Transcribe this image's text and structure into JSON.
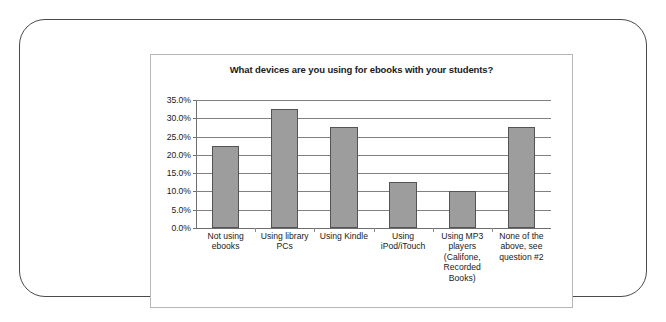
{
  "chart_data": {
    "type": "bar",
    "title": "What devices are you using for ebooks with your students?",
    "xlabel": "",
    "ylabel": "",
    "categories": [
      "Not using ebooks",
      "Using library PCs",
      "Using Kindle",
      "Using iPod/iTouch",
      "Using MP3 players (Califone, Recorded Books)",
      "None of the above, see question #2"
    ],
    "values": [
      22.5,
      32.5,
      27.5,
      12.5,
      10.0,
      27.5
    ],
    "ylim": [
      0,
      35
    ],
    "ytick_labels": [
      "35.0%",
      "30.0%",
      "25.0%",
      "20.0%",
      "15.0%",
      "10.0%",
      "5.0%",
      "0.0%"
    ],
    "ytick_values": [
      35,
      30,
      25,
      20,
      15,
      10,
      5,
      0
    ],
    "grid": true,
    "legend": "none",
    "bar_color": "#9d9d9d",
    "bar_border_color": "#545454",
    "grid_color": "#808080",
    "text_color": "#1a1a1a"
  },
  "frame": {
    "border_color": "#4a4a4a",
    "chart_box_border_color": "#b7b7b7"
  }
}
